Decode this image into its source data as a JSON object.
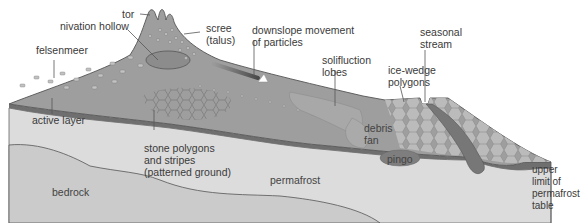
{
  "diagram": {
    "colors": {
      "surface": "#9a9a9a",
      "surface_light": "#b4b4b4",
      "active_layer": "#6f6f6f",
      "permafrost": "#dcdcdc",
      "bedrock": "#c8c8c8",
      "outline": "#555555",
      "label": "#3a3a3a"
    },
    "labels": {
      "tor": "tor",
      "nivation_hollow": "nivation hollow",
      "scree": "scree\n(talus)",
      "downslope": "downslope movement\nof particles",
      "felsenmeer": "felsenmeer",
      "solifluction": "solifluction\nlobes",
      "ice_wedge": "ice-wedge\npolygons",
      "seasonal_stream": "seasonal\nstream",
      "active_layer": "active layer",
      "stone_polygons": "stone polygons\nand stripes\n(patterned ground)",
      "debris_fan": "debris\nfan",
      "pingo": "pingo",
      "bedrock": "bedrock",
      "permafrost": "permafrost",
      "upper_limit": "upper\nlimit of\npermafrost\ntable"
    }
  }
}
